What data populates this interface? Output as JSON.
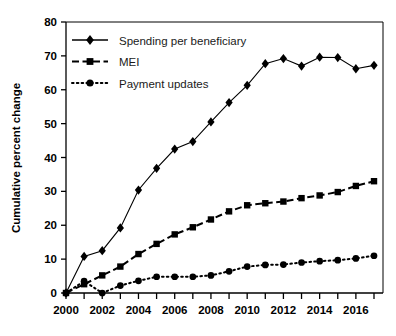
{
  "chart_data": {
    "type": "line",
    "title": "",
    "xlabel": "",
    "ylabel": "Cumulative percent change",
    "xlim": [
      2000,
      2017
    ],
    "ylim": [
      0,
      80
    ],
    "grid": false,
    "legend_position": "top-left",
    "x": [
      2000,
      2001,
      2002,
      2003,
      2004,
      2005,
      2006,
      2007,
      2008,
      2009,
      2010,
      2011,
      2012,
      2013,
      2014,
      2015,
      2016,
      2017
    ],
    "xticks": [
      2000,
      2002,
      2004,
      2006,
      2008,
      2010,
      2012,
      2014,
      2016
    ],
    "xticklabels": [
      "2000",
      "2002",
      "2004",
      "2006",
      "2008",
      "2010",
      "2012",
      "2014",
      "2016"
    ],
    "yticks": [
      0,
      10,
      20,
      30,
      40,
      50,
      60,
      70,
      80
    ],
    "yticklabels": [
      "0",
      "10",
      "20",
      "30",
      "40",
      "50",
      "60",
      "70",
      "80"
    ],
    "series": [
      {
        "name": "Spending per beneficiary",
        "marker": "diamond",
        "linestyle": "solid",
        "color": "#000000",
        "values": [
          0,
          10.8,
          12.5,
          19.2,
          30.4,
          36.8,
          42.5,
          44.7,
          50.5,
          56.2,
          61.3,
          67.7,
          69.2,
          67.0,
          69.6,
          69.5,
          66.2,
          67.2
        ]
      },
      {
        "name": "MEI",
        "marker": "square",
        "linestyle": "dashed",
        "color": "#000000",
        "values": [
          0,
          2.6,
          5.2,
          7.8,
          11.5,
          14.5,
          17.3,
          19.4,
          21.7,
          24.1,
          25.9,
          26.5,
          27.0,
          28.0,
          28.8,
          29.8,
          31.6,
          33.0
        ]
      },
      {
        "name": "Payment updates",
        "marker": "circle",
        "linestyle": "dotted",
        "color": "#000000",
        "values": [
          0,
          3.5,
          0.0,
          2.2,
          3.6,
          4.8,
          4.8,
          4.8,
          5.2,
          6.4,
          7.8,
          8.3,
          8.4,
          9.0,
          9.4,
          9.7,
          10.2,
          11.0
        ]
      }
    ]
  },
  "legend": {
    "items": [
      {
        "label": "Spending per beneficiary"
      },
      {
        "label": "MEI"
      },
      {
        "label": "Payment updates"
      }
    ]
  }
}
